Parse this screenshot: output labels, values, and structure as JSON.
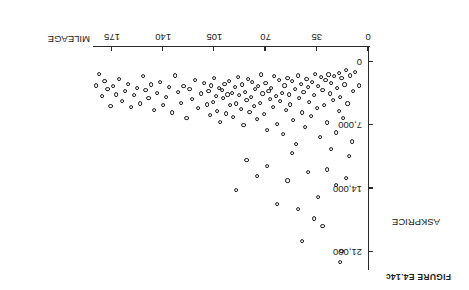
{
  "figure": {
    "caption": "FIGURE E4.14c",
    "orientation_note": "rotated-180"
  },
  "chart_data": {
    "type": "scatter",
    "title": "FIGURE E4.14c",
    "xlabel": "MILEAGE",
    "ylabel": "ASKPRICE",
    "xlim": [
      0,
      190
    ],
    "ylim": [
      0,
      23500
    ],
    "grid": false,
    "legend": null,
    "xticks": [
      0,
      35,
      70,
      105,
      140,
      175
    ],
    "xtick_labels": [
      "0",
      "35",
      "70",
      "105",
      "140",
      "175"
    ],
    "yticks": [
      0,
      7000,
      14000,
      21000
    ],
    "ytick_labels": [
      "0",
      "7,000",
      "14,000",
      "21,000"
    ],
    "marker": "open-circle",
    "n_points": 157,
    "points": [
      [
        6,
        2600
      ],
      [
        9,
        1100
      ],
      [
        10,
        3200
      ],
      [
        12,
        1500
      ],
      [
        14,
        4600
      ],
      [
        15,
        900
      ],
      [
        16,
        2500
      ],
      [
        17,
        6200
      ],
      [
        18,
        1800
      ],
      [
        19,
        3900
      ],
      [
        20,
        1200
      ],
      [
        20,
        5400
      ],
      [
        21,
        2900
      ],
      [
        22,
        7800
      ],
      [
        23,
        1600
      ],
      [
        24,
        4200
      ],
      [
        25,
        2300
      ],
      [
        25,
        9600
      ],
      [
        26,
        3500
      ],
      [
        27,
        1400
      ],
      [
        28,
        6700
      ],
      [
        29,
        2000
      ],
      [
        30,
        4800
      ],
      [
        31,
        3100
      ],
      [
        32,
        1700
      ],
      [
        33,
        8300
      ],
      [
        34,
        2700
      ],
      [
        35,
        5100
      ],
      [
        36,
        1300
      ],
      [
        37,
        3700
      ],
      [
        38,
        2200
      ],
      [
        39,
        6000
      ],
      [
        40,
        4400
      ],
      [
        41,
        2800
      ],
      [
        42,
        1900
      ],
      [
        43,
        7200
      ],
      [
        44,
        3300
      ],
      [
        45,
        5600
      ],
      [
        46,
        2400
      ],
      [
        47,
        4000
      ],
      [
        48,
        1500
      ],
      [
        49,
        9100
      ],
      [
        50,
        3000
      ],
      [
        51,
        6400
      ],
      [
        52,
        2100
      ],
      [
        53,
        4700
      ],
      [
        54,
        3600
      ],
      [
        55,
        1800
      ],
      [
        56,
        5300
      ],
      [
        57,
        2600
      ],
      [
        58,
        8000
      ],
      [
        59,
        3400
      ],
      [
        60,
        4300
      ],
      [
        61,
        2000
      ],
      [
        62,
        6900
      ],
      [
        63,
        3800
      ],
      [
        64,
        1600
      ],
      [
        65,
        5000
      ],
      [
        66,
        2900
      ],
      [
        67,
        4100
      ],
      [
        68,
        3200
      ],
      [
        69,
        7500
      ],
      [
        70,
        2300
      ],
      [
        71,
        5800
      ],
      [
        72,
        3500
      ],
      [
        73,
        1400
      ],
      [
        74,
        4500
      ],
      [
        75,
        2700
      ],
      [
        76,
        6300
      ],
      [
        77,
        3000
      ],
      [
        78,
        4900
      ],
      [
        79,
        2200
      ],
      [
        80,
        3900
      ],
      [
        81,
        5500
      ],
      [
        82,
        1900
      ],
      [
        83,
        4200
      ],
      [
        84,
        3300
      ],
      [
        85,
        7000
      ],
      [
        86,
        2500
      ],
      [
        87,
        5200
      ],
      [
        88,
        3700
      ],
      [
        89,
        1700
      ],
      [
        90,
        4600
      ],
      [
        91,
        2800
      ],
      [
        92,
        6100
      ],
      [
        93,
        3400
      ],
      [
        94,
        4800
      ],
      [
        95,
        2100
      ],
      [
        96,
        3600
      ],
      [
        97,
        5700
      ],
      [
        98,
        2400
      ],
      [
        99,
        4000
      ],
      [
        100,
        3100
      ],
      [
        101,
        6600
      ],
      [
        102,
        2900
      ],
      [
        103,
        5400
      ],
      [
        104,
        3800
      ],
      [
        105,
        1800
      ],
      [
        106,
        4400
      ],
      [
        107,
        2600
      ],
      [
        108,
        5900
      ],
      [
        109,
        3200
      ],
      [
        110,
        4700
      ],
      [
        112,
        2300
      ],
      [
        114,
        3500
      ],
      [
        116,
        5100
      ],
      [
        118,
        2000
      ],
      [
        120,
        4100
      ],
      [
        122,
        3000
      ],
      [
        124,
        6200
      ],
      [
        126,
        2700
      ],
      [
        128,
        4500
      ],
      [
        130,
        3300
      ],
      [
        132,
        1500
      ],
      [
        134,
        5600
      ],
      [
        136,
        2800
      ],
      [
        138,
        3900
      ],
      [
        140,
        4800
      ],
      [
        142,
        2200
      ],
      [
        144,
        3400
      ],
      [
        146,
        5300
      ],
      [
        148,
        2500
      ],
      [
        150,
        4000
      ],
      [
        152,
        3100
      ],
      [
        154,
        1600
      ],
      [
        156,
        4600
      ],
      [
        158,
        2900
      ],
      [
        160,
        3700
      ],
      [
        162,
        5000
      ],
      [
        164,
        2400
      ],
      [
        166,
        3200
      ],
      [
        168,
        4300
      ],
      [
        170,
        1900
      ],
      [
        172,
        3600
      ],
      [
        174,
        2700
      ],
      [
        176,
        4900
      ],
      [
        178,
        3000
      ],
      [
        180,
        2100
      ],
      [
        182,
        3800
      ],
      [
        184,
        1300
      ],
      [
        186,
        2600
      ],
      [
        15,
        12800
      ],
      [
        22,
        13600
      ],
      [
        28,
        11900
      ],
      [
        34,
        14900
      ],
      [
        41,
        12200
      ],
      [
        48,
        16300
      ],
      [
        55,
        13100
      ],
      [
        62,
        15700
      ],
      [
        69,
        11500
      ],
      [
        76,
        12600
      ],
      [
        83,
        10800
      ],
      [
        90,
        14200
      ],
      [
        18,
        20900
      ],
      [
        19,
        22100
      ],
      [
        45,
        19800
      ],
      [
        31,
        18100
      ],
      [
        37,
        17300
      ],
      [
        52,
        10100
      ],
      [
        11,
        8800
      ],
      [
        13,
        10400
      ]
    ]
  }
}
